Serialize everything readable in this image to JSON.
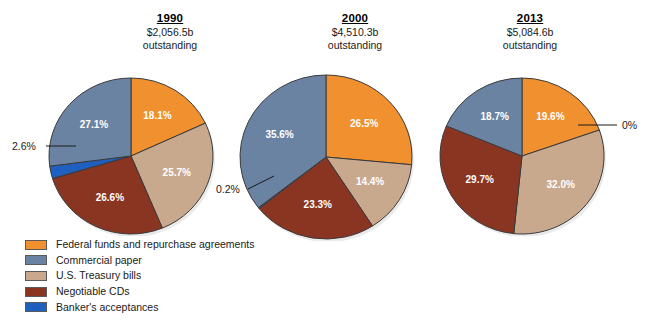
{
  "chart_data": {
    "type": "pie",
    "title": "",
    "subtitle": "",
    "legend_position": "bottom-left",
    "categories": [
      "Federal funds and repurchase agreements",
      "Commercial paper",
      "U.S. Treasury bills",
      "Negotiable CDs",
      "Banker's acceptances"
    ],
    "colors": {
      "federal_funds": "#F0902E",
      "commercial_paper": "#6B83A3",
      "treasury_bills": "#C9A98E",
      "negotiable_cds": "#8A3522",
      "bankers_acceptances": "#1F5FBF"
    },
    "pies": [
      {
        "year": "1990",
        "amount": "$2,056.5b",
        "outstanding_label": "outstanding",
        "slices": [
          {
            "category": "Federal funds and repurchase agreements",
            "value": 18.1,
            "label": "18.1%",
            "color": "#F0902E",
            "inside": true
          },
          {
            "category": "U.S. Treasury bills",
            "value": 25.7,
            "label": "25.7%",
            "color": "#C9A98E",
            "inside": true
          },
          {
            "category": "Negotiable CDs",
            "value": 26.6,
            "label": "26.6%",
            "color": "#8A3522",
            "inside": true
          },
          {
            "category": "Banker's acceptances",
            "value": 2.6,
            "label": "2.6%",
            "color": "#1F5FBF",
            "inside": false
          },
          {
            "category": "Commercial paper",
            "value": 27.1,
            "label": "27.1%",
            "color": "#6B83A3",
            "inside": true
          }
        ]
      },
      {
        "year": "2000",
        "amount": "$4,510.3b",
        "outstanding_label": "outstanding",
        "slices": [
          {
            "category": "Federal funds and repurchase agreements",
            "value": 26.5,
            "label": "26.5%",
            "color": "#F0902E",
            "inside": true
          },
          {
            "category": "U.S. Treasury bills",
            "value": 14.4,
            "label": "14.4%",
            "color": "#C9A98E",
            "inside": true
          },
          {
            "category": "Negotiable CDs",
            "value": 23.3,
            "label": "23.3%",
            "color": "#8A3522",
            "inside": true
          },
          {
            "category": "Banker's acceptances",
            "value": 0.2,
            "label": "0.2%",
            "color": "#1F5FBF",
            "inside": false
          },
          {
            "category": "Commercial paper",
            "value": 35.6,
            "label": "35.6%",
            "color": "#6B83A3",
            "inside": true
          }
        ]
      },
      {
        "year": "2013",
        "amount": "$5,084.6b",
        "outstanding_label": "outstanding",
        "slices": [
          {
            "category": "Federal funds and repurchase agreements",
            "value": 19.6,
            "label": "19.6%",
            "color": "#F0902E",
            "inside": true
          },
          {
            "category": "U.S. Treasury bills",
            "value": 32.0,
            "label": "32.0%",
            "color": "#C9A98E",
            "inside": true
          },
          {
            "category": "Negotiable CDs",
            "value": 29.7,
            "label": "29.7%",
            "color": "#8A3522",
            "inside": true
          },
          {
            "category": "Banker's acceptances",
            "value": 0.0,
            "label": "0%",
            "color": "#1F5FBF",
            "inside": false
          },
          {
            "category": "Commercial paper",
            "value": 18.7,
            "label": "18.7%",
            "color": "#6B83A3",
            "inside": true
          }
        ]
      }
    ]
  },
  "headers": [
    {
      "year": "1990",
      "amount": "$2,056.5b",
      "outstanding": "outstanding"
    },
    {
      "year": "2000",
      "amount": "$4,510.3b",
      "outstanding": "outstanding"
    },
    {
      "year": "2013",
      "amount": "$5,084.6b",
      "outstanding": "outstanding"
    }
  ],
  "callouts": [
    {
      "id": "callout-1990-bankers",
      "text": "2.6%"
    },
    {
      "id": "callout-2000-bankers",
      "text": "0.2%"
    },
    {
      "id": "callout-2013-bankers",
      "text": "0%"
    }
  ],
  "legend": {
    "items": [
      {
        "label": "Federal funds and repurchase agreements",
        "color": "#F0902E",
        "name": "legend-federal-funds"
      },
      {
        "label": "Commercial paper",
        "color": "#6B83A3",
        "name": "legend-commercial-paper"
      },
      {
        "label": "U.S. Treasury bills",
        "color": "#C9A98E",
        "name": "legend-treasury-bills"
      },
      {
        "label": "Negotiable CDs",
        "color": "#8A3522",
        "name": "legend-negotiable-cds"
      },
      {
        "label": "Banker's acceptances",
        "color": "#1F5FBF",
        "name": "legend-bankers-acceptances"
      }
    ]
  }
}
